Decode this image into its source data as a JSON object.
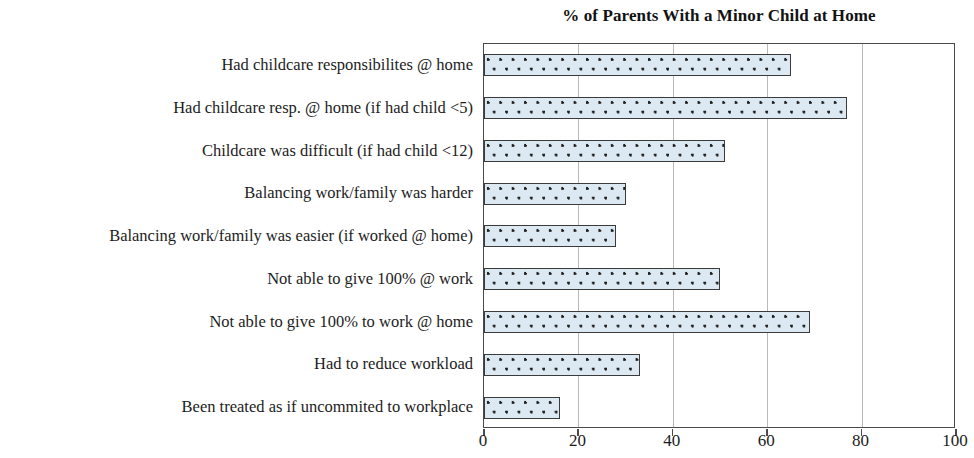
{
  "chart_data": {
    "type": "bar",
    "orientation": "horizontal",
    "title": "% of Parents With a Minor Child at Home",
    "xlabel": "",
    "ylabel": "",
    "xlim": [
      0,
      100
    ],
    "xticks": [
      0,
      20,
      40,
      60,
      80,
      100
    ],
    "xtick_labels": [
      "0",
      "20",
      "40",
      "60",
      "80",
      "100"
    ],
    "grid": true,
    "grid_axis": "x",
    "legend": false,
    "bar_fill_color": "#dce9f2",
    "bar_pattern": "dotted",
    "bar_border_color": "#3b3b3b",
    "gridline_color": "#b9b9b9",
    "categories": [
      "Had childcare responsibilites @ home",
      "Had childcare resp. @ home (if had child <5)",
      "Childcare was difficult (if had child <12)",
      "Balancing work/family was harder",
      "Balancing work/family was easier (if worked @ home)",
      "Not able to give 100% @ work",
      "Not able to give 100% to work @ home",
      "Had to reduce workload",
      "Been treated as if uncommited to workplace"
    ],
    "values": [
      65,
      77,
      51,
      30,
      28,
      50,
      69,
      33,
      16
    ]
  }
}
